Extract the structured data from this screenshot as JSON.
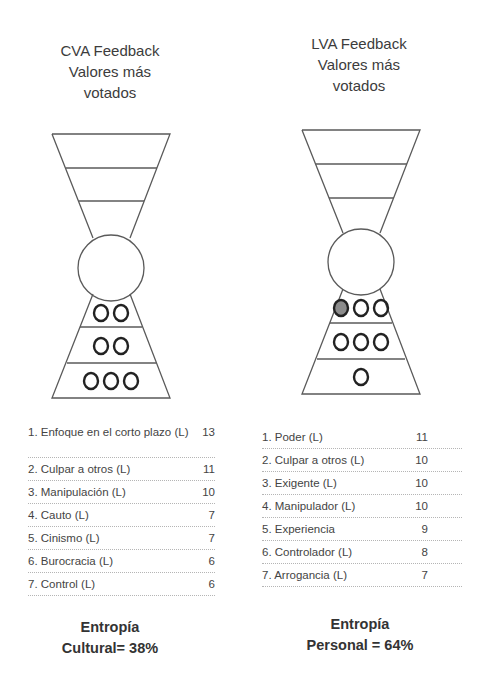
{
  "left_panel": {
    "title_lines": [
      "CVA Feedback",
      "Valores más",
      "votados"
    ],
    "hourglass": {
      "upper_bands": 3,
      "lower_bands": [
        {
          "circles": 2,
          "filled": 0
        },
        {
          "circles": 2,
          "filled": 0
        },
        {
          "circles": 3,
          "filled": 0
        }
      ]
    },
    "values": [
      {
        "label": "1. Enfoque en el corto plazo (L)",
        "votes": "13"
      },
      {
        "label": "2. Culpar a otros (L)",
        "votes": "11"
      },
      {
        "label": "3. Manipulación (L)",
        "votes": "10"
      },
      {
        "label": "4. Cauto (L)",
        "votes": "7"
      },
      {
        "label": "5. Cinismo (L)",
        "votes": "7"
      },
      {
        "label": "6. Burocracia (L)",
        "votes": "6"
      },
      {
        "label": "7. Control (L)",
        "votes": "6"
      }
    ],
    "entropy_lines": [
      "Entropía",
      "Cultural= 38%"
    ]
  },
  "right_panel": {
    "title_lines": [
      "LVA Feedback",
      "Valores más",
      "votados"
    ],
    "hourglass": {
      "upper_bands": 3,
      "lower_bands": [
        {
          "circles": 3,
          "filled": 1
        },
        {
          "circles": 3,
          "filled": 0
        },
        {
          "circles": 1,
          "filled": 0
        }
      ]
    },
    "values": [
      {
        "label": "1. Poder (L)",
        "votes": "11"
      },
      {
        "label": "2. Culpar a otros (L)",
        "votes": "10"
      },
      {
        "label": "3. Exigente  (L)",
        "votes": "10"
      },
      {
        "label": "4. Manipulador (L)",
        "votes": "10"
      },
      {
        "label": "5. Experiencia",
        "votes": "9"
      },
      {
        "label": "6. Controlador (L)",
        "votes": "8"
      },
      {
        "label": "7. Arrogancia (L)",
        "votes": "7"
      }
    ],
    "entropy_lines": [
      "Entropía",
      "Personal = 64%"
    ]
  },
  "colors": {
    "outline": "#555555",
    "circle_stroke": "#2a2a2a",
    "circle_filled": "#8a8a8a",
    "text": "#3a3a3a"
  }
}
